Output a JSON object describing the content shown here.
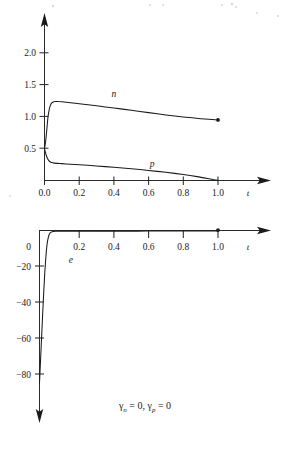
{
  "figure": {
    "caption": "γₙ = 0, γₚ = 0",
    "caption_parts": {
      "gamma_n": "γ",
      "sub_n": "n",
      "eq1": " = 0, ",
      "gamma_p": "γ",
      "sub_p": "p",
      "eq2": " = 0"
    }
  },
  "chart_data": [
    {
      "id": "top",
      "type": "line",
      "title": "",
      "xlabel": "t",
      "ylabel": "",
      "xlim": [
        0.0,
        1.12
      ],
      "ylim": [
        0.0,
        2.35
      ],
      "xticks": [
        0.0,
        0.2,
        0.4,
        0.6,
        0.8,
        1.0
      ],
      "xticklabels": [
        "0.0",
        "0.2",
        "0.4",
        "0.6",
        "0.8",
        "1.0"
      ],
      "yticks": [
        0.5,
        1.0,
        1.5,
        2.0
      ],
      "yticklabels": [
        "0.5",
        "1.0",
        "1.5",
        "2.0"
      ],
      "grid": false,
      "legend": "inline-annotations",
      "series": [
        {
          "name": "n",
          "label": "n",
          "label_at": [
            0.4,
            1.3
          ],
          "endpoint_marker": true,
          "points": [
            [
              0.0,
              0.5
            ],
            [
              0.004,
              0.56
            ],
            [
              0.008,
              0.65
            ],
            [
              0.012,
              0.76
            ],
            [
              0.016,
              0.88
            ],
            [
              0.02,
              0.99
            ],
            [
              0.025,
              1.08
            ],
            [
              0.03,
              1.145
            ],
            [
              0.036,
              1.19
            ],
            [
              0.042,
              1.215
            ],
            [
              0.05,
              1.23
            ],
            [
              0.06,
              1.237
            ],
            [
              0.075,
              1.238
            ],
            [
              0.1,
              1.232
            ],
            [
              0.15,
              1.218
            ],
            [
              0.2,
              1.203
            ],
            [
              0.3,
              1.17
            ],
            [
              0.4,
              1.135
            ],
            [
              0.5,
              1.1
            ],
            [
              0.6,
              1.063
            ],
            [
              0.7,
              1.027
            ],
            [
              0.8,
              0.995
            ],
            [
              0.9,
              0.968
            ],
            [
              1.0,
              0.948
            ]
          ]
        },
        {
          "name": "p",
          "label": "p",
          "label_at": [
            0.62,
            0.215
          ],
          "endpoint_marker": false,
          "points": [
            [
              0.0,
              0.5
            ],
            [
              0.005,
              0.445
            ],
            [
              0.01,
              0.395
            ],
            [
              0.016,
              0.352
            ],
            [
              0.024,
              0.315
            ],
            [
              0.032,
              0.293
            ],
            [
              0.042,
              0.28
            ],
            [
              0.055,
              0.272
            ],
            [
              0.075,
              0.268
            ],
            [
              0.1,
              0.264
            ],
            [
              0.15,
              0.256
            ],
            [
              0.2,
              0.247
            ],
            [
              0.3,
              0.228
            ],
            [
              0.4,
              0.207
            ],
            [
              0.5,
              0.184
            ],
            [
              0.6,
              0.158
            ],
            [
              0.7,
              0.128
            ],
            [
              0.8,
              0.094
            ],
            [
              0.88,
              0.061
            ],
            [
              0.94,
              0.031
            ],
            [
              0.975,
              0.012
            ],
            [
              1.0,
              0.002
            ]
          ]
        }
      ]
    },
    {
      "id": "bottom",
      "type": "line",
      "title": "",
      "xlabel": "t",
      "ylabel": "",
      "xlim": [
        0.0,
        1.12
      ],
      "ylim": [
        -96.0,
        4.0
      ],
      "xticks": [
        0.2,
        0.4,
        0.6,
        0.8,
        1.0
      ],
      "xticklabels": [
        "0.2",
        "0.4",
        "0.6",
        "0.8",
        "1.0"
      ],
      "yticks": [
        0,
        -20,
        -40,
        -60,
        -80
      ],
      "yticklabels": [
        "0",
        "−20",
        "−40",
        "−60",
        "−80"
      ],
      "grid": false,
      "legend": "inline-annotations",
      "series": [
        {
          "name": "e",
          "label": "e",
          "label_at": [
            0.175,
            -18.0
          ],
          "endpoint_marker": true,
          "points": [
            [
              0.0,
              -85.0
            ],
            [
              0.006,
              -72.0
            ],
            [
              0.012,
              -59.0
            ],
            [
              0.018,
              -46.0
            ],
            [
              0.024,
              -34.0
            ],
            [
              0.03,
              -23.0
            ],
            [
              0.036,
              -14.5
            ],
            [
              0.042,
              -8.0
            ],
            [
              0.05,
              -3.6
            ],
            [
              0.058,
              -1.5
            ],
            [
              0.07,
              -0.7
            ],
            [
              0.09,
              -0.45
            ],
            [
              0.12,
              -0.4
            ],
            [
              0.2,
              -0.38
            ],
            [
              0.3,
              -0.36
            ],
            [
              0.4,
              -0.35
            ],
            [
              0.5,
              -0.34
            ],
            [
              0.6,
              -0.33
            ],
            [
              0.7,
              -0.32
            ],
            [
              0.8,
              -0.31
            ],
            [
              0.9,
              -0.3
            ],
            [
              1.0,
              -0.3
            ]
          ]
        }
      ]
    }
  ]
}
